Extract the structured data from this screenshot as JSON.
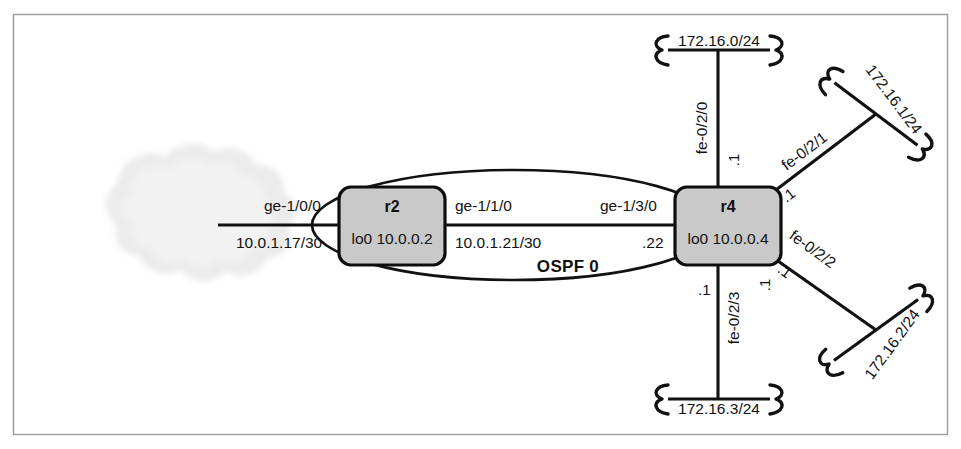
{
  "figure": {
    "ospf_area_label": "OSPF 0",
    "frame_color": "#9a9a9a",
    "router_fill_color": "#c9c9c9",
    "line_color": "#111111",
    "cloud_color": "#ededed"
  },
  "cloud": {
    "name": "external-network-cloud"
  },
  "routers": [
    {
      "id": "r2",
      "name": "r2",
      "loopback": "lo0 10.0.0.2"
    },
    {
      "id": "r4",
      "name": "r4",
      "loopback": "lo0 10.0.0.4"
    }
  ],
  "links": {
    "cloud_to_r2": {
      "interface": "ge-1/0/0",
      "subnet": "10.0.1.17/30"
    },
    "r2_to_r4_upper": {
      "interface_left": "ge-1/1/0",
      "subnet_left": "10.0.1.21/30",
      "interface_right": "ge-1/3/0",
      "address_right": ".22"
    },
    "r2_to_r4_lower": {
      "address_right": ".1"
    }
  },
  "lans": [
    {
      "id": "lan-top",
      "subnet": "172.16.0/24",
      "interface": "fe-0/2/0",
      "address": ".1"
    },
    {
      "id": "lan-upper-right",
      "subnet": "172.16.1/24",
      "interface": "fe-0/2/1",
      "address": ".1"
    },
    {
      "id": "lan-lower-right",
      "subnet": "172.16.2/24",
      "interface": "fe-0/2/2",
      "address": ".1"
    },
    {
      "id": "lan-bottom",
      "subnet": "172.16.3/24",
      "interface": "fe-0/2/3",
      "address": ".1"
    }
  ]
}
